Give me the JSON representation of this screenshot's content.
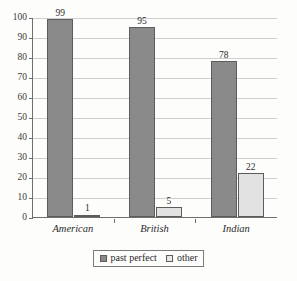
{
  "chart_data": {
    "type": "bar",
    "title": "",
    "subtitle": "",
    "xlabel": "",
    "ylabel": "",
    "categories": [
      "American",
      "British",
      "Indian"
    ],
    "series": [
      {
        "name": "past perfect",
        "values": [
          99,
          95,
          78
        ],
        "color": "#8a8a8a"
      },
      {
        "name": "other",
        "values": [
          1,
          5,
          22
        ],
        "color": "#e2e2e2"
      }
    ],
    "ylim": [
      0,
      100
    ],
    "ytick_labels": [
      "0",
      "10",
      "20",
      "30",
      "40",
      "50",
      "60",
      "70",
      "80",
      "90",
      "100"
    ],
    "ytick_values": [
      0,
      10,
      20,
      30,
      40,
      50,
      60,
      70,
      80,
      90,
      100
    ],
    "grid": true,
    "grid_axis": "y",
    "legend_position": "bottom",
    "data_labels": [
      [
        "99",
        "95",
        "78"
      ],
      [
        "1",
        "5",
        "22"
      ]
    ]
  },
  "legend": {
    "items": [
      {
        "label": "past perfect",
        "swatch": "legend-swatch-past-perfect"
      },
      {
        "label": "other",
        "swatch": "legend-swatch-other"
      }
    ]
  },
  "colors": {
    "background": "#fdfdfb",
    "axis": "#6e6e6e",
    "gridline": "#cfcfcf",
    "bar_border": "#5d5d5d",
    "series_past_perfect": "#8a8a8a",
    "series_other": "#e2e2e2",
    "text": "#2b2b2b"
  }
}
